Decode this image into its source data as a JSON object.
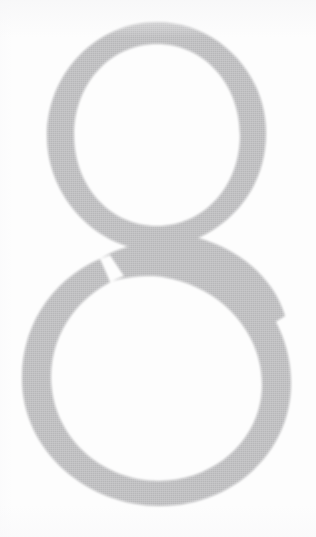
{
  "document": {
    "kind": "scanned-page-fragment",
    "character": "8",
    "character_name": "numeral-eight",
    "description": "Large gray numeral eight on white background",
    "typeface_style": "serif-modulated"
  },
  "canvas": {
    "width": 316,
    "height": 537,
    "background_color": "#fdfdfd"
  },
  "glyph": {
    "label": "8",
    "fill_color": "#b7b7b9",
    "counter_color": "#fdfdfd",
    "bounds": {
      "left": 22,
      "top": 22,
      "right": 291,
      "bottom": 506
    },
    "upper_bowl": {
      "left": 47,
      "top": 22,
      "right": 266,
      "bottom": 252
    },
    "lower_bowl": {
      "left": 22,
      "top": 243,
      "right": 291,
      "bottom": 506
    },
    "waist_y": 248,
    "stroke_thin_px": 17,
    "stroke_thick_px": 31
  },
  "chart_data": {
    "type": "table",
    "columns": [
      "feature",
      "x_min",
      "y_min",
      "x_max",
      "y_max"
    ],
    "rows": [
      [
        "glyph bounding box",
        22,
        22,
        291,
        506
      ],
      [
        "upper bowl outer",
        47,
        22,
        266,
        252
      ],
      [
        "upper counter",
        92,
        44,
        221,
        216
      ],
      [
        "lower bowl outer",
        22,
        243,
        291,
        506
      ],
      [
        "lower counter",
        55,
        276,
        266,
        486
      ]
    ]
  }
}
